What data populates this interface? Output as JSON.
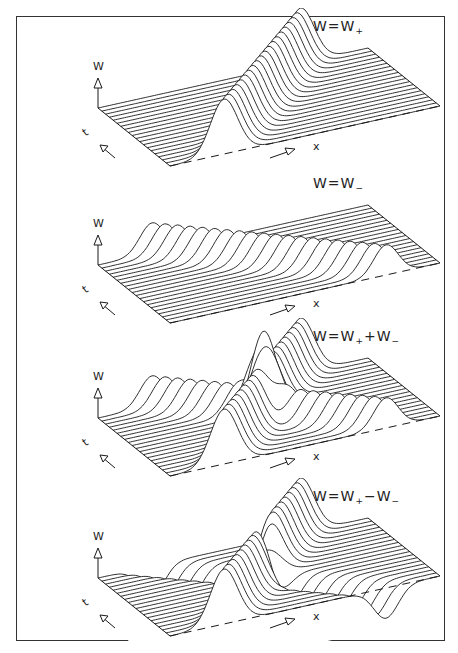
{
  "figure": {
    "panel_count": 4,
    "line_color": "#1a1a1a",
    "background": "#ffffff"
  },
  "panels": [
    {
      "title_main": "W=W",
      "title_sub": "+",
      "title_tail": "",
      "title_sub2": "",
      "w_axis_label": "W",
      "t_axis_label": "t",
      "x_axis_label": "x",
      "mode": "plus"
    },
    {
      "title_main": "W=W",
      "title_sub": "−",
      "title_tail": "",
      "title_sub2": "",
      "w_axis_label": "W",
      "t_axis_label": "t",
      "x_axis_label": "x",
      "mode": "minus"
    },
    {
      "title_main": "W=W",
      "title_sub": "+",
      "title_tail": "+W",
      "title_sub2": "−",
      "w_axis_label": "W",
      "t_axis_label": "t",
      "x_axis_label": "x",
      "mode": "sum"
    },
    {
      "title_main": "W=W",
      "title_sub": "+",
      "title_tail": "−W",
      "title_sub2": "−",
      "w_axis_label": "W",
      "t_axis_label": "t",
      "x_axis_label": "x",
      "mode": "diff"
    }
  ],
  "chart_data": [
    {
      "type": "area",
      "title": "W = W+",
      "xlabel": "x",
      "ylabel": "t",
      "zlabel": "W",
      "description": "Right-moving pulse: peak travels along increasing x as t increases",
      "num_traces": 20,
      "peak_height": 1.0
    },
    {
      "type": "area",
      "title": "W = W−",
      "xlabel": "x",
      "ylabel": "t",
      "zlabel": "W",
      "description": "Left-moving pulse: peak travels along decreasing x as t increases",
      "num_traces": 20,
      "peak_height": 0.5
    },
    {
      "type": "area",
      "title": "W = W+ + W−",
      "xlabel": "x",
      "ylabel": "t",
      "zlabel": "W",
      "description": "Superposition of right- and left-moving pulses with constructive interference at crossing",
      "num_traces": 20
    },
    {
      "type": "area",
      "title": "W = W+ − W−",
      "xlabel": "x",
      "ylabel": "t",
      "zlabel": "W",
      "description": "Difference of pulses; negative trough from W− with destructive interference at crossing",
      "num_traces": 20
    }
  ]
}
